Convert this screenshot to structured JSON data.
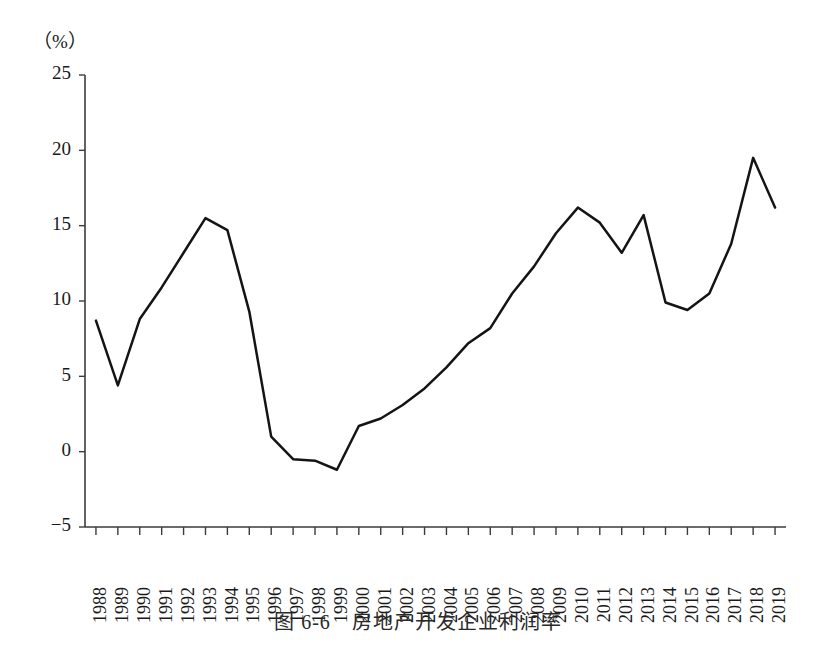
{
  "caption": "图 6-6　房地产开发企业利润率",
  "axis": {
    "y_unit_label": "（%）",
    "y_ticks": [
      "25",
      "20",
      "15",
      "10",
      "5",
      "0",
      "−5"
    ]
  },
  "chart_data": {
    "type": "line",
    "title": "图 6-6　房地产开发企业利润率",
    "xlabel": "",
    "ylabel": "（%）",
    "ylim": [
      -5,
      25
    ],
    "ytick_values": [
      25,
      20,
      15,
      10,
      5,
      0,
      -5
    ],
    "grid": false,
    "legend": "none",
    "categories": [
      "1988",
      "1989",
      "1990",
      "1991",
      "1992",
      "1993",
      "1994",
      "1995",
      "1996",
      "1997",
      "1998",
      "1999",
      "2000",
      "2001",
      "2002",
      "2003",
      "2004",
      "2005",
      "2006",
      "2007",
      "2008",
      "2009",
      "2010",
      "2011",
      "2012",
      "2013",
      "2014",
      "2015",
      "2016",
      "2017",
      "2018",
      "2019"
    ],
    "values": [
      8.7,
      4.4,
      8.8,
      10.9,
      13.2,
      15.5,
      14.7,
      9.3,
      1.0,
      -0.5,
      -0.6,
      -1.2,
      1.7,
      2.2,
      3.1,
      4.2,
      5.6,
      7.2,
      8.2,
      10.5,
      12.3,
      14.5,
      16.2,
      15.2,
      13.2,
      15.7,
      9.9,
      9.4,
      10.5,
      13.8,
      19.5,
      16.2
    ]
  },
  "layout": {
    "plot_left": 85,
    "plot_right": 786,
    "y_top_px": 75,
    "y_bottom_px": 527,
    "y_top_value": 25,
    "y_bottom_value": -5
  },
  "colors": {
    "line": "#141414",
    "axis": "#3b3b3b",
    "background": "#ffffff",
    "text": "#1a1a1a"
  }
}
